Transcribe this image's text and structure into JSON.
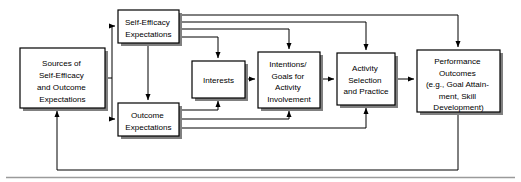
{
  "diagram": {
    "type": "flowchart",
    "style": {
      "box_fill": "#ffffff",
      "box_stroke": "#000000",
      "shadow": "#808080",
      "line": "#000000",
      "background": "#ffffff"
    },
    "boxes": [
      {
        "id": "sources",
        "name": "sources-of-self-efficacy-and-outcome-expectations",
        "lines": [
          "Sources of",
          "Self-Efficacy",
          "and Outcome",
          "Expectations"
        ],
        "x": 20,
        "y": 48,
        "w": 85,
        "h": 60
      },
      {
        "id": "self_efficacy",
        "name": "self-efficacy-expectations",
        "lines": [
          "Self-Efficacy",
          "Expectations"
        ],
        "x": 118,
        "y": 10,
        "w": 61,
        "h": 33
      },
      {
        "id": "outcome",
        "name": "outcome-expectations",
        "lines": [
          "Outcome",
          "Expectations"
        ],
        "x": 118,
        "y": 103,
        "w": 61,
        "h": 33
      },
      {
        "id": "interests",
        "name": "interests",
        "lines": [
          "Interests"
        ],
        "x": 192,
        "y": 61,
        "w": 53,
        "h": 37
      },
      {
        "id": "intentions",
        "name": "intentions-goals-for-activity-involvement",
        "lines": [
          "Intentions/",
          "Goals for",
          "Activity",
          "Involvement"
        ],
        "x": 258,
        "y": 52,
        "w": 62,
        "h": 56
      },
      {
        "id": "activity",
        "name": "activity-selection-and-practice",
        "lines": [
          "Activity",
          "Selection",
          "and Practice"
        ],
        "x": 337,
        "y": 53,
        "w": 58,
        "h": 52
      },
      {
        "id": "performance",
        "name": "performance-outcomes",
        "lines": [
          "Performance",
          "Outcomes",
          "(e.g., Goal Attain-",
          "ment, Skill",
          "Development)"
        ],
        "x": 417,
        "y": 50,
        "w": 83,
        "h": 62
      }
    ],
    "connections": [
      {
        "from": "sources",
        "to": "self_efficacy",
        "name": "sources-to-self-efficacy"
      },
      {
        "from": "sources",
        "to": "outcome",
        "name": "sources-to-outcome"
      },
      {
        "from": "self_efficacy",
        "to": "outcome",
        "name": "self-efficacy-to-outcome"
      },
      {
        "from": "self_efficacy",
        "to": "interests",
        "name": "self-efficacy-to-interests"
      },
      {
        "from": "self_efficacy",
        "to": "intentions",
        "name": "self-efficacy-to-intentions"
      },
      {
        "from": "self_efficacy",
        "to": "activity",
        "name": "self-efficacy-to-activity"
      },
      {
        "from": "self_efficacy",
        "to": "performance",
        "name": "self-efficacy-to-performance"
      },
      {
        "from": "outcome",
        "to": "interests",
        "name": "outcome-to-interests"
      },
      {
        "from": "outcome",
        "to": "intentions",
        "name": "outcome-to-intentions"
      },
      {
        "from": "outcome",
        "to": "activity",
        "name": "outcome-to-activity"
      },
      {
        "from": "interests",
        "to": "intentions",
        "name": "interests-to-intentions"
      },
      {
        "from": "intentions",
        "to": "activity",
        "name": "intentions-to-activity"
      },
      {
        "from": "activity",
        "to": "performance",
        "name": "activity-to-performance"
      },
      {
        "from": "performance",
        "to": "sources",
        "name": "performance-feedback-to-sources"
      }
    ],
    "footer_rule": {
      "name": "bottom-rule",
      "y": 177
    }
  }
}
